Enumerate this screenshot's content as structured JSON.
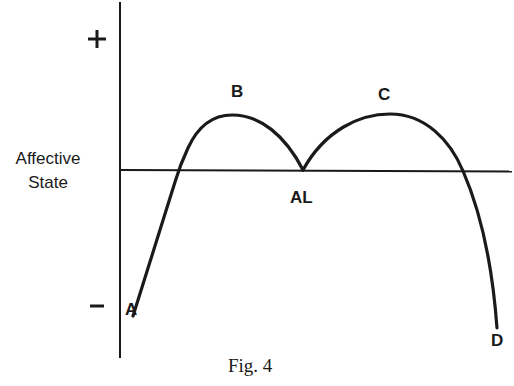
{
  "figure": {
    "caption": "Fig. 4",
    "y_axis_label_line1": "Affective",
    "y_axis_label_line2": "State",
    "plus_sign": "+",
    "minus_sign": "−",
    "points": {
      "A": "A",
      "B": "B",
      "AL": "AL",
      "C": "C",
      "D": "D"
    },
    "colors": {
      "ink": "#1a1a1a",
      "background": "#ffffff"
    }
  }
}
